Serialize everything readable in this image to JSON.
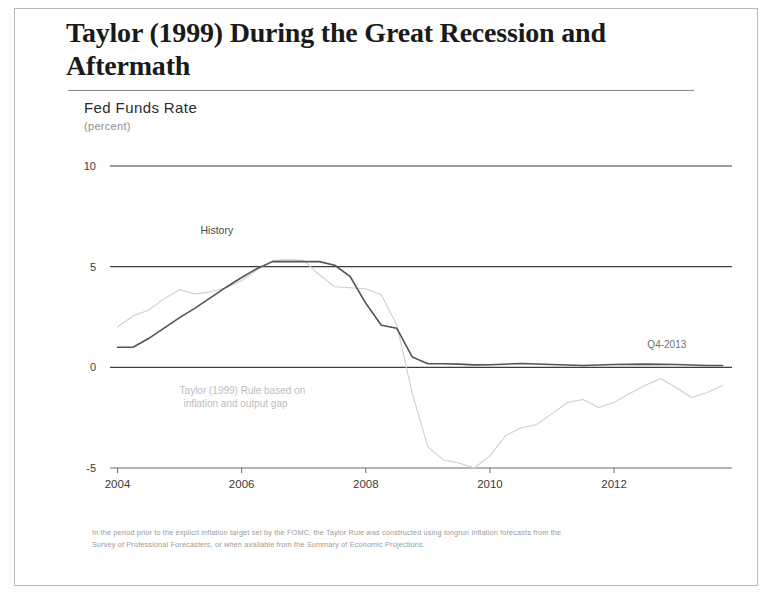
{
  "slide": {
    "title": "Taylor (1999) During the Great Recession and Aftermath",
    "footnote_line1": "In the period prior to the explicit inflation target set by the FOMC, the Taylor Rule was constructed using longrun inflation forecasts from the",
    "footnote_line2": "Survey of Professional Forecasters, or when available from the Summary of Economic Projections."
  },
  "chart_data": {
    "type": "line",
    "title": "Fed Funds Rate",
    "subtitle": "(percent)",
    "xlabel": "",
    "ylabel": "Fed Funds Rate",
    "xlim": [
      2003.75,
      2013.9
    ],
    "ylim": [
      -5,
      10
    ],
    "yticks": [
      10,
      5,
      0,
      -5
    ],
    "ytick_labels": [
      "10",
      "5",
      "0",
      "-5"
    ],
    "xticks": [
      2004,
      2006,
      2008,
      2010,
      2012
    ],
    "xtick_labels": [
      "2004",
      "2006",
      "2008",
      "2010",
      "2012"
    ],
    "grid": "horizontal-at-yticks",
    "legend_position": "inline-annotations",
    "annotations": [
      {
        "name": "history",
        "text": "History",
        "x": 2005.6,
        "y": 6.6
      },
      {
        "name": "taylor-rule",
        "text_line1": "Taylor (1999) Rule based on",
        "text_line2": "inflation and output gap",
        "x": 2005.0,
        "y": -1.3
      },
      {
        "name": "end-label",
        "text": "Q4-2013",
        "x": 2012.85,
        "y": 0.95
      }
    ],
    "series": [
      {
        "name": "History (effective federal funds rate)",
        "color": "#545454",
        "x": [
          2004.0,
          2004.25,
          2004.5,
          2004.75,
          2005.0,
          2005.25,
          2005.5,
          2005.75,
          2006.0,
          2006.25,
          2006.5,
          2006.75,
          2007.0,
          2007.25,
          2007.5,
          2007.75,
          2008.0,
          2008.25,
          2008.5,
          2008.75,
          2009.0,
          2009.25,
          2009.5,
          2009.75,
          2010.0,
          2010.5,
          2011.0,
          2011.5,
          2012.0,
          2012.5,
          2013.0,
          2013.5,
          2013.75
        ],
        "values": [
          1.0,
          1.0,
          1.43,
          1.95,
          2.47,
          2.94,
          3.46,
          3.98,
          4.46,
          4.91,
          5.25,
          5.25,
          5.26,
          5.25,
          5.07,
          4.5,
          3.18,
          2.09,
          1.94,
          0.51,
          0.18,
          0.18,
          0.16,
          0.12,
          0.13,
          0.19,
          0.14,
          0.09,
          0.14,
          0.16,
          0.14,
          0.09,
          0.09
        ]
      },
      {
        "name": "Taylor (1999) Rule based on inflation and output gap",
        "color": "#cfcfcf",
        "x": [
          2004.0,
          2004.25,
          2004.5,
          2004.75,
          2005.0,
          2005.25,
          2005.5,
          2005.75,
          2006.0,
          2006.25,
          2006.5,
          2006.75,
          2007.0,
          2007.25,
          2007.5,
          2007.75,
          2008.0,
          2008.25,
          2008.5,
          2008.75,
          2009.0,
          2009.25,
          2009.5,
          2009.75,
          2010.0,
          2010.25,
          2010.5,
          2010.75,
          2011.0,
          2011.25,
          2011.5,
          2011.75,
          2012.0,
          2012.25,
          2012.5,
          2012.75,
          2013.0,
          2013.25,
          2013.5,
          2013.75
        ],
        "values": [
          2.0,
          2.55,
          2.85,
          3.4,
          3.85,
          3.65,
          3.75,
          3.95,
          4.3,
          4.85,
          5.3,
          5.35,
          5.3,
          4.6,
          4.0,
          3.95,
          3.9,
          3.6,
          2.1,
          -1.3,
          -3.95,
          -4.6,
          -4.75,
          -5.0,
          -4.4,
          -3.4,
          -3.0,
          -2.85,
          -2.3,
          -1.75,
          -1.6,
          -2.0,
          -1.75,
          -1.3,
          -0.9,
          -0.55,
          -1.0,
          -1.5,
          -1.25,
          -0.9
        ]
      }
    ]
  }
}
